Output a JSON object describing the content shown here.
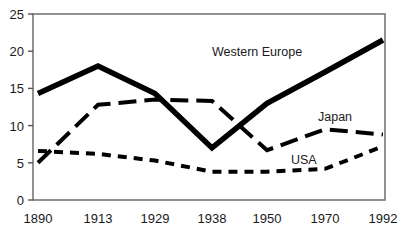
{
  "chart_data": {
    "type": "line",
    "title": "",
    "subtitle": "",
    "xlabel": "",
    "ylabel": "",
    "x": [
      1890,
      1913,
      1929,
      1938,
      1950,
      1970,
      1992
    ],
    "x_tick_labels": [
      "1890",
      "1913",
      "1929",
      "1938",
      "1950",
      "1970",
      "1992"
    ],
    "y_tick_labels": [
      "0",
      "5",
      "10",
      "15",
      "20",
      "25"
    ],
    "y_ticks": [
      0,
      5,
      10,
      15,
      20,
      25
    ],
    "ylim": [
      0,
      25
    ],
    "xlim": [
      1890,
      1992
    ],
    "grid": false,
    "legend_position": "inline-annotations",
    "axis_style": "box-frame",
    "series": [
      {
        "name": "Western Europe",
        "line_style": "solid",
        "line_width": 5,
        "color": "#000000",
        "label_x": 1934,
        "label_y": 21.5,
        "values": [
          14.3,
          18.0,
          14.3,
          7.0,
          13.0,
          17.2,
          21.5
        ]
      },
      {
        "name": "Japan",
        "line_style": "long-dash",
        "line_width": 4,
        "color": "#000000",
        "label_x": 1968,
        "label_y": 11.8,
        "values": [
          5.0,
          12.8,
          13.5,
          13.3,
          6.7,
          9.5,
          8.8
        ]
      },
      {
        "name": "USA",
        "line_style": "short-dash",
        "line_width": 4,
        "color": "#000000",
        "label_x": 1955,
        "label_y": 6.2,
        "values": [
          6.6,
          6.2,
          5.3,
          3.8,
          3.8,
          4.2,
          7.2
        ]
      }
    ],
    "annotations": [
      {
        "text": "Western Europe",
        "x": 212,
        "y": 56
      },
      {
        "text": "Japan",
        "x": 318,
        "y": 121
      },
      {
        "text": "USA",
        "x": 291,
        "y": 164
      }
    ]
  },
  "frame": {
    "left": 33,
    "right": 385,
    "top": 14,
    "bottom": 200,
    "border_color": "#777777"
  }
}
